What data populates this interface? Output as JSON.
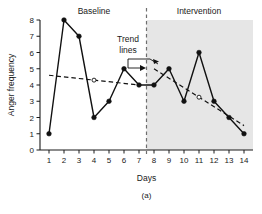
{
  "chart_data": {
    "type": "line",
    "title": "",
    "caption": "(a)",
    "xlabel": "Days",
    "ylabel": "Anger frequency",
    "x": [
      1,
      2,
      3,
      4,
      5,
      6,
      7,
      8,
      9,
      10,
      11,
      12,
      13,
      14
    ],
    "categories": [
      "1",
      "2",
      "3",
      "4",
      "5",
      "6",
      "7",
      "8",
      "9",
      "10",
      "11",
      "12",
      "13",
      "14"
    ],
    "values": [
      1,
      8,
      7,
      2,
      3,
      5,
      4,
      4,
      5,
      3,
      6,
      3,
      2,
      1
    ],
    "series": [
      {
        "name": "Anger frequency",
        "values": [
          1,
          8,
          7,
          2,
          3,
          5,
          4,
          4,
          5,
          3,
          6,
          3,
          2,
          1
        ]
      }
    ],
    "xlim": [
      0.4,
      14.6
    ],
    "ylim": [
      0,
      8
    ],
    "yticks": [
      0,
      1,
      2,
      3,
      4,
      5,
      6,
      7,
      8
    ],
    "ytick_labels": [
      "0",
      "1",
      "2",
      "3",
      "4",
      "5",
      "6",
      "7",
      "8"
    ],
    "xticks": [
      1,
      2,
      3,
      4,
      5,
      6,
      7,
      8,
      9,
      10,
      11,
      12,
      13,
      14
    ],
    "grid": false,
    "legend": "none",
    "phases": [
      {
        "name": "Baseline",
        "label": "Baseline",
        "x_start": 1,
        "x_end": 7,
        "shaded": false,
        "label_x": 4.0
      },
      {
        "name": "Intervention",
        "label": "Intervention",
        "x_start": 8,
        "x_end": 14,
        "shaded": true,
        "shade_color": "#e6e6e6",
        "label_x": 11.0
      }
    ],
    "phase_change_line": {
      "x": 7.5,
      "style": "dashed",
      "color": "#6e6e6e"
    },
    "trend_lines": [
      {
        "phase": "Baseline",
        "x_start": 1,
        "y_start": 4.6,
        "x_end": 7,
        "y_end": 4.0,
        "midpoint_marker": {
          "x": 4,
          "y": 4.3,
          "style": "open-circle"
        },
        "style": "dashed"
      },
      {
        "phase": "Intervention",
        "x_start": 8,
        "y_start": 5.0,
        "x_end": 14,
        "y_end": 1.5,
        "midpoint_marker": {
          "x": 11,
          "y": 3.25,
          "style": "open-circle"
        },
        "style": "dashed"
      }
    ],
    "annotations": [
      {
        "name": "trend-lines-annotation",
        "text_line_1": "Trend",
        "text_line_2": "lines",
        "points_to": [
          "baseline-trend-line",
          "intervention-trend-line"
        ]
      }
    ]
  }
}
